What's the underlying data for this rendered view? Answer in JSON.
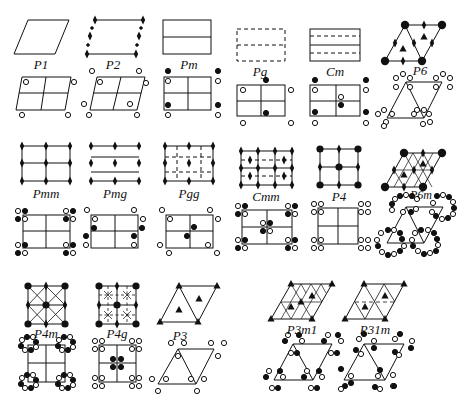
{
  "groups": [
    {
      "id": "p1",
      "label": "P1"
    },
    {
      "id": "p2",
      "label": "P2"
    },
    {
      "id": "pm",
      "label": "Pm"
    },
    {
      "id": "pg",
      "label": "Pg"
    },
    {
      "id": "cm",
      "label": "Cm"
    },
    {
      "id": "p6",
      "label": "P6"
    },
    {
      "id": "pmm",
      "label": "Pmm"
    },
    {
      "id": "pmg",
      "label": "Pmg"
    },
    {
      "id": "pgg",
      "label": "Pgg"
    },
    {
      "id": "cmm",
      "label": "Cmm"
    },
    {
      "id": "p4",
      "label": "P4"
    },
    {
      "id": "p6m",
      "label": "P6m"
    },
    {
      "id": "p4m",
      "label": "P4m"
    },
    {
      "id": "p4g",
      "label": "P4g"
    },
    {
      "id": "p3",
      "label": "P3"
    },
    {
      "id": "p3m1",
      "label": "P3m1"
    },
    {
      "id": "p31m",
      "label": "P31m"
    }
  ],
  "legend": {
    "open_circle": "motif (right-handed)",
    "filled_circle": "motif (mirror image)",
    "diamond": "2-fold rotation axis",
    "triangle": "3-fold rotation axis",
    "square": "4-fold rotation axis",
    "hexagon": "6-fold rotation axis",
    "solid_line": "mirror line",
    "dashed_line": "glide line"
  },
  "colors": {
    "ink": "#111111",
    "background": "#ffffff"
  }
}
